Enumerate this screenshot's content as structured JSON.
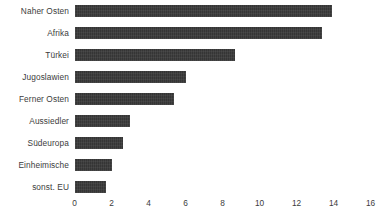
{
  "chart_data": {
    "type": "bar",
    "orientation": "horizontal",
    "title": "",
    "xlabel": "",
    "ylabel": "",
    "categories": [
      "Naher Osten",
      "Afrika",
      "Türkei",
      "Jugoslawien",
      "Ferner Osten",
      "Aussiedler",
      "Südeuropa",
      "Einheimische",
      "sonst. EU"
    ],
    "values": [
      13.9,
      13.4,
      8.7,
      6.0,
      5.4,
      3.0,
      2.6,
      2.0,
      1.7
    ],
    "xlim": [
      0,
      16
    ],
    "xticks": [
      0,
      2,
      4,
      6,
      8,
      10,
      12,
      14,
      16
    ],
    "xtick_labels": [
      "0",
      "2",
      "4",
      "6",
      "8",
      "10",
      "12",
      "14",
      "16"
    ],
    "grid": false,
    "legend": null,
    "bar_color": "#3a3a3a",
    "text_color": "#3c3c3c",
    "background_color": "#ffffff"
  }
}
